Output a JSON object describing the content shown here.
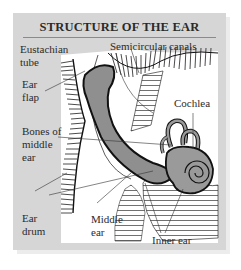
{
  "title": "STRUCTURE OF THE EAR",
  "labels": {
    "eustachian_tube": "Eustachian\ntube",
    "semicircular_canals": "Semicircular canals",
    "ear_flap": "Ear\nflap",
    "cochlea": "Cochlea",
    "bones_of_middle_ear": "Bones of\nmiddle\near",
    "ear_drum": "Ear\ndrum",
    "middle_ear": "Middle\near",
    "inner_ear": "Inner ear"
  },
  "colors": {
    "panel_bg": "#d6d6d6",
    "diagram_bg": "#ffffff",
    "tissue_fill": "#8f8f8f",
    "cochlea_fill": "#9a9a9a",
    "line": "#222222"
  }
}
